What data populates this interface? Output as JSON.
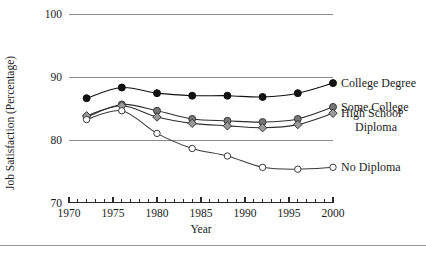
{
  "chart_data": {
    "type": "line",
    "title": "",
    "xlabel": "Year",
    "ylabel": "Job Satisfaction (Percentage)",
    "x": [
      1972,
      1976,
      1980,
      1984,
      1988,
      1992,
      1996,
      2000
    ],
    "xlim": [
      1970,
      2000
    ],
    "ylim": [
      70,
      100
    ],
    "grid": true,
    "legend_position": "inline-right",
    "y_ticks": [
      "70",
      "80",
      "90",
      "100"
    ],
    "y_tick_values": [
      70,
      80,
      90,
      100
    ],
    "x_ticks": [
      "1970",
      "1975",
      "1980",
      "1985",
      "1990",
      "1995",
      "2000"
    ],
    "x_tick_values": [
      1970,
      1975,
      1980,
      1985,
      1990,
      1995,
      2000
    ],
    "x_minor_step": 1,
    "series": [
      {
        "name": "College Degree",
        "label_lines": [
          "College Degree"
        ],
        "marker": "filled-circle",
        "color": "#111111",
        "marker_fill": "#111111",
        "marker_stroke": "#111111",
        "values": [
          86.6,
          88.3,
          87.4,
          87.0,
          87.0,
          86.8,
          87.4,
          89.0
        ]
      },
      {
        "name": "Some College",
        "label_lines": [
          "Some College"
        ],
        "marker": "filled-circle",
        "color": "#2e2e2e",
        "marker_fill": "#767676",
        "marker_stroke": "#3a3a3a",
        "values": [
          83.6,
          85.6,
          84.6,
          83.3,
          83.0,
          82.8,
          83.3,
          85.2
        ]
      },
      {
        "name": "High School Diploma",
        "label_lines": [
          "High School",
          "Diploma"
        ],
        "marker": "filled-diamond",
        "color": "#2e2e2e",
        "marker_fill": "#9a9a9a",
        "marker_stroke": "#3a3a3a",
        "values": [
          83.8,
          85.4,
          83.6,
          82.6,
          82.2,
          81.9,
          82.4,
          84.2
        ]
      },
      {
        "name": "No Diploma",
        "label_lines": [
          "No Diploma"
        ],
        "marker": "open-circle",
        "color": "#3a3a3a",
        "marker_fill": "#ffffff",
        "marker_stroke": "#3a3a3a",
        "values": [
          83.2,
          84.6,
          81.0,
          78.6,
          77.4,
          75.6,
          75.3,
          75.6
        ]
      }
    ]
  },
  "colors": {
    "gridline": "#8d8d8d",
    "axis": "#2a2a2a",
    "text": "#1c1c1c",
    "footer_rule": "#9a9a9a"
  }
}
